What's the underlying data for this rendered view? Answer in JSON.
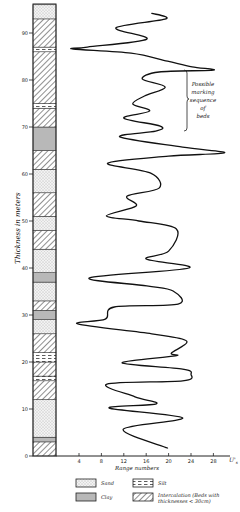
{
  "chart_data": {
    "type": "line",
    "title": "",
    "orientation": "vertical-profile",
    "xlabel": "Range numbers",
    "x_unit_label": "U's",
    "ylabel": "Thickness in meters",
    "xlim": [
      0,
      30
    ],
    "ylim": [
      0,
      95
    ],
    "x_ticks": [
      4,
      8,
      12,
      16,
      20,
      24,
      28
    ],
    "y_ticks": [
      0,
      10,
      20,
      30,
      40,
      50,
      60,
      70,
      80,
      90
    ],
    "grid": false,
    "series": [
      {
        "name": "Range number curve",
        "points_value_thickness": [
          [
            17.0,
            94.2
          ],
          [
            19.5,
            93.0
          ],
          [
            10.6,
            91.1
          ],
          [
            16.1,
            88.7
          ],
          [
            5.5,
            87.0
          ],
          [
            3.0,
            86.6
          ],
          [
            13.3,
            85.7
          ],
          [
            19.8,
            84.0
          ],
          [
            24.2,
            82.8
          ],
          [
            28.0,
            82.1
          ],
          [
            18.3,
            81.7
          ],
          [
            15.3,
            80.2
          ],
          [
            19.4,
            78.5
          ],
          [
            15.7,
            76.6
          ],
          [
            13.6,
            74.9
          ],
          [
            16.6,
            73.4
          ],
          [
            12.0,
            71.9
          ],
          [
            18.5,
            70.2
          ],
          [
            17.7,
            69.1
          ],
          [
            11.3,
            67.9
          ],
          [
            22.5,
            65.7
          ],
          [
            30.0,
            64.5
          ],
          [
            20.0,
            63.8
          ],
          [
            9.1,
            62.3
          ],
          [
            16.8,
            60.2
          ],
          [
            18.3,
            57.0
          ],
          [
            12.6,
            55.3
          ],
          [
            14.2,
            53.2
          ],
          [
            8.9,
            51.1
          ],
          [
            14.7,
            50.0
          ],
          [
            21.4,
            48.3
          ],
          [
            20.0,
            43.6
          ],
          [
            16.0,
            41.9
          ],
          [
            23.6,
            40.0
          ],
          [
            5.9,
            37.9
          ],
          [
            16.1,
            36.2
          ],
          [
            20.8,
            35.1
          ],
          [
            21.7,
            32.3
          ],
          [
            10.3,
            31.7
          ],
          [
            8.7,
            29.1
          ],
          [
            3.8,
            28.1
          ],
          [
            17.0,
            26.0
          ],
          [
            23.2,
            24.5
          ],
          [
            20.5,
            21.9
          ],
          [
            21.2,
            21.3
          ],
          [
            11.7,
            19.8
          ],
          [
            22.5,
            18.5
          ],
          [
            24.0,
            17.4
          ],
          [
            22.5,
            16.0
          ],
          [
            9.0,
            15.3
          ],
          [
            14.0,
            12.6
          ],
          [
            17.8,
            11.1
          ],
          [
            9.4,
            10.2
          ],
          [
            22.5,
            8.1
          ],
          [
            11.9,
            5.7
          ],
          [
            19.8,
            1.7
          ]
        ]
      }
    ],
    "annotations": [
      {
        "text": "Possible marking sequence of beds",
        "bracket_thickness_range": [
          67,
          82
        ]
      }
    ],
    "lithology_column": {
      "description": "Stratigraphic column of bed types from 0 to ~96 m",
      "layers_from_bottom": [
        {
          "type": "intercalation",
          "from": 0,
          "to": 3
        },
        {
          "type": "clay",
          "from": 3,
          "to": 4
        },
        {
          "type": "sand",
          "from": 4,
          "to": 12
        },
        {
          "type": "intercalation",
          "from": 12,
          "to": 16
        },
        {
          "type": "silt",
          "from": 16,
          "to": 17
        },
        {
          "type": "intercalation",
          "from": 17,
          "to": 20
        },
        {
          "type": "silt",
          "from": 20,
          "to": 22
        },
        {
          "type": "intercalation",
          "from": 22,
          "to": 26
        },
        {
          "type": "sand",
          "from": 26,
          "to": 29
        },
        {
          "type": "clay",
          "from": 29,
          "to": 31
        },
        {
          "type": "intercalation",
          "from": 31,
          "to": 33
        },
        {
          "type": "sand",
          "from": 33,
          "to": 37
        },
        {
          "type": "clay",
          "from": 37,
          "to": 39
        },
        {
          "type": "sand",
          "from": 39,
          "to": 44
        },
        {
          "type": "intercalation",
          "from": 44,
          "to": 48
        },
        {
          "type": "sand",
          "from": 48,
          "to": 51
        },
        {
          "type": "intercalation",
          "from": 51,
          "to": 56
        },
        {
          "type": "sand",
          "from": 56,
          "to": 61
        },
        {
          "type": "intercalation",
          "from": 61,
          "to": 65
        },
        {
          "type": "clay",
          "from": 65,
          "to": 70
        },
        {
          "type": "intercalation",
          "from": 70,
          "to": 74
        },
        {
          "type": "silt",
          "from": 74,
          "to": 75
        },
        {
          "type": "intercalation",
          "from": 75,
          "to": 86
        },
        {
          "type": "silt",
          "from": 86,
          "to": 87
        },
        {
          "type": "intercalation",
          "from": 87,
          "to": 93
        },
        {
          "type": "sand",
          "from": 93,
          "to": 96
        }
      ]
    },
    "legend": [
      {
        "key": "sand",
        "label": "Sand"
      },
      {
        "key": "silt",
        "label": "Silt"
      },
      {
        "key": "clay",
        "label": "Clay"
      },
      {
        "key": "intercalation",
        "label": "Intercalation (Beds with thicknesses < 30cm)"
      }
    ]
  },
  "labels": {
    "ylabel": "Thickness in meters",
    "xlabel": "Range numbers",
    "x_unit": "U'",
    "x_unit_sub": "s",
    "annotation_lines": [
      "Possible",
      "marking",
      "sequence",
      "of",
      "beds"
    ],
    "legend_sand": "Sand",
    "legend_silt": "Silt",
    "legend_clay": "Clay",
    "legend_inter_1": "Intercalation (Beds with",
    "legend_inter_2": "thicknesses < 30cm)"
  },
  "colors": {
    "ink": "#1a1a1a",
    "paper": "#ffffff"
  }
}
